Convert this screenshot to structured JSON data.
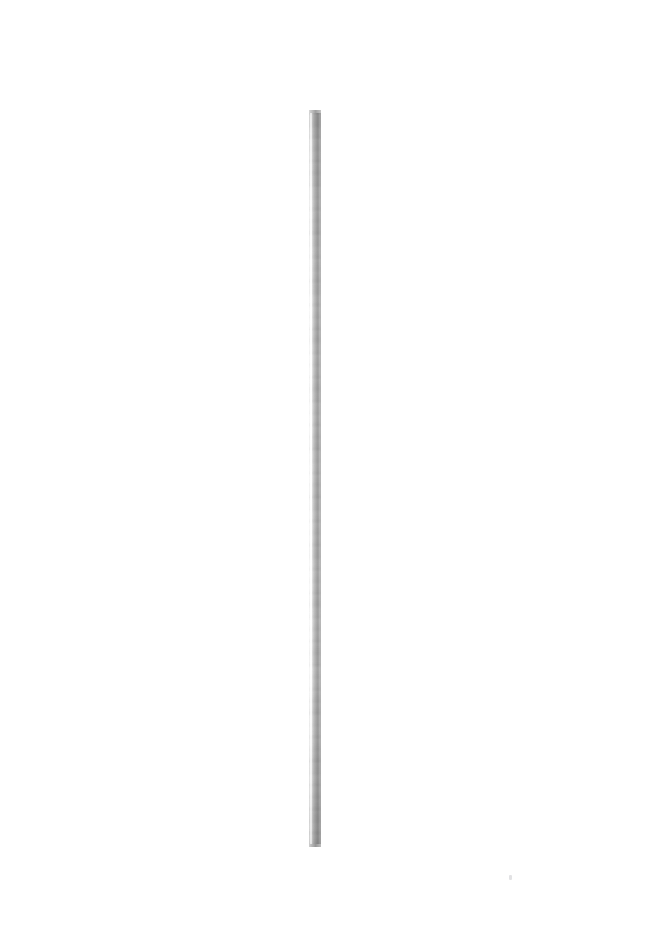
{
  "canvas": {
    "width": 652,
    "height": 928,
    "background_color": "#ffffff",
    "alt_text": "Single thin vertical galvanized steel rod on plain white background"
  },
  "subject": {
    "name": "galvanized steel rod",
    "orientation": "vertical",
    "left_px": 309,
    "top_px": 110,
    "width_px": 12,
    "height_px": 737,
    "end_style": "flat square cut",
    "finish": "galvanized / mottled spangle",
    "highlight_side": "left",
    "colors": {
      "highlight": "#ffffff",
      "mid_tone": "#b2b2b2",
      "shadow": "#9a9a9a",
      "edge": "#ececec",
      "cap_top": "#a0a0a0",
      "cap_bottom": "#969696"
    }
  },
  "artifacts": {
    "speck": {
      "name": "faint sensor speck",
      "left_px": 509,
      "top_px": 875,
      "color": "#a0a0a5"
    }
  }
}
